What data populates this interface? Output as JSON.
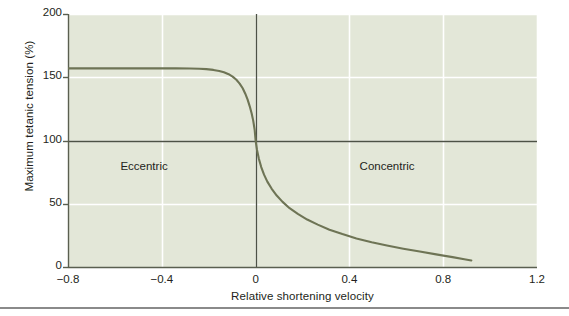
{
  "figure": {
    "background": "#ffffff",
    "plot_background": "#e3e7d8",
    "grid_color": "#ffffff",
    "axis_color": "#5a5f50",
    "curve_color": "#6e7455",
    "text_color": "#231f20"
  },
  "chart_data": {
    "type": "line",
    "title": "",
    "subtitle": "",
    "xlabel": "Relative shortening velocity",
    "ylabel": "Maximum tetanic tension (%)",
    "xlim": [
      -0.8,
      1.2
    ],
    "ylim": [
      0,
      200
    ],
    "xticks": [
      "−0.8",
      "−0.4",
      "0",
      "0.4",
      "0.8",
      "1.2"
    ],
    "xtick_values": [
      -0.8,
      -0.4,
      0,
      0.4,
      0.8,
      1.2
    ],
    "yticks": [
      "0",
      "50",
      "100",
      "150",
      "200"
    ],
    "ytick_values": [
      0,
      50,
      100,
      150,
      200
    ],
    "grid": true,
    "legend": "none",
    "reference_lines": [
      {
        "name": "isometric-tension-line",
        "orientation": "horizontal",
        "value": 100
      },
      {
        "name": "zero-velocity-line",
        "orientation": "vertical",
        "value": 0
      }
    ],
    "annotations": [
      {
        "name": "eccentric-label",
        "text": "Eccentric",
        "x": -0.44,
        "y": 78
      },
      {
        "name": "concentric-label",
        "text": "Concentric",
        "x": 0.58,
        "y": 78
      }
    ],
    "series": [
      {
        "name": "force-velocity-curve",
        "color": "#6e7455",
        "x": [
          -0.8,
          -0.7,
          -0.6,
          -0.5,
          -0.4,
          -0.34,
          -0.28,
          -0.24,
          -0.21,
          -0.18,
          -0.155,
          -0.135,
          -0.115,
          -0.098,
          -0.082,
          -0.068,
          -0.055,
          -0.044,
          -0.034,
          -0.025,
          -0.017,
          -0.01,
          -0.004,
          0.0,
          0.006,
          0.014,
          0.024,
          0.036,
          0.05,
          0.068,
          0.09,
          0.115,
          0.145,
          0.18,
          0.22,
          0.265,
          0.315,
          0.37,
          0.43,
          0.495,
          0.56,
          0.63,
          0.7,
          0.77,
          0.84,
          0.89,
          0.92
        ],
        "y": [
          157.0,
          157.0,
          157.0,
          157.0,
          157.0,
          157.0,
          156.9,
          156.7,
          156.4,
          155.8,
          155.0,
          154.0,
          152.4,
          150.5,
          148.0,
          145.0,
          141.3,
          137.0,
          132.3,
          127.0,
          121.5,
          115.5,
          108.5,
          100.0,
          92.5,
          85.5,
          79.0,
          73.0,
          67.5,
          62.0,
          56.5,
          51.5,
          46.5,
          42.0,
          37.5,
          33.5,
          29.5,
          26.0,
          22.5,
          19.5,
          17.0,
          14.5,
          12.2,
          10.0,
          7.8,
          6.2,
          5.2
        ]
      }
    ]
  }
}
